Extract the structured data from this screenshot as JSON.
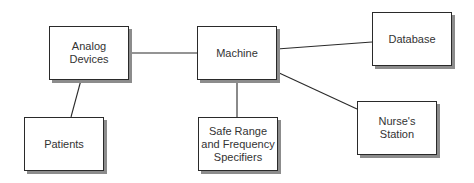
{
  "diagram": {
    "type": "block-diagram",
    "nodes": [
      {
        "id": "analog",
        "label": "Analog\nDevices",
        "x": 49,
        "y": 26,
        "w": 80,
        "h": 54
      },
      {
        "id": "machine",
        "label": "Machine",
        "x": 197,
        "y": 26,
        "w": 80,
        "h": 54
      },
      {
        "id": "database",
        "label": "Database",
        "x": 372,
        "y": 12,
        "w": 80,
        "h": 54
      },
      {
        "id": "patients",
        "label": "Patients",
        "x": 24,
        "y": 117,
        "w": 80,
        "h": 54
      },
      {
        "id": "safe_range",
        "label": "Safe Range\nand Frequency\nSpecifiers",
        "x": 198,
        "y": 117,
        "w": 80,
        "h": 54
      },
      {
        "id": "nurses",
        "label": "Nurse's\nStation",
        "x": 357,
        "y": 101,
        "w": 80,
        "h": 54
      }
    ],
    "edges": [
      {
        "from": "analog",
        "to": "machine",
        "x1": 129,
        "y1": 53,
        "x2": 197,
        "y2": 53
      },
      {
        "from": "analog",
        "to": "patients",
        "x1": 81,
        "y1": 80,
        "x2": 71,
        "y2": 117
      },
      {
        "from": "machine",
        "to": "database",
        "x1": 277,
        "y1": 49,
        "x2": 372,
        "y2": 42
      },
      {
        "from": "machine",
        "to": "safe_range",
        "x1": 237,
        "y1": 80,
        "x2": 237,
        "y2": 117
      },
      {
        "from": "machine",
        "to": "nurses",
        "x1": 277,
        "y1": 72,
        "x2": 357,
        "y2": 109
      }
    ],
    "colors": {
      "border": "#2a2a2a",
      "shadow": "#8c8c8c",
      "text": "#333333",
      "line": "#2a2a2a",
      "background": "#ffffff"
    }
  }
}
